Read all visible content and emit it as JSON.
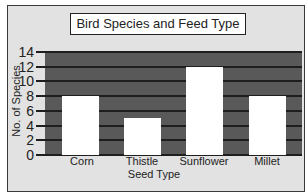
{
  "chart_data": {
    "type": "bar",
    "title": "Bird Species and Feed Type",
    "xlabel": "Seed Type",
    "ylabel": "No. of Species",
    "categories": [
      "Corn",
      "Thistle",
      "Sunflower",
      "Millet"
    ],
    "values": [
      8,
      5,
      12,
      8
    ],
    "ylim": [
      0,
      14
    ],
    "yticks": [
      0,
      2,
      4,
      6,
      8,
      10,
      12,
      14
    ],
    "grid": true,
    "legend": null,
    "colors": {
      "plot_background": "#595959",
      "bars": "#ffffff",
      "gridlines": "#1e1e1e",
      "frame_background": "#e2e2e2"
    }
  }
}
